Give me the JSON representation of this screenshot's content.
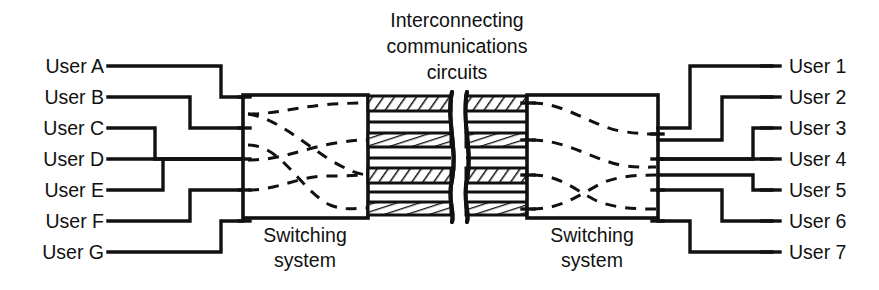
{
  "figure": {
    "title_lines": [
      "Interconnecting",
      "communications",
      "circuits"
    ],
    "title_full": "Interconnecting communications circuits",
    "background_color": "#ffffff",
    "line_color": "#111111",
    "hatch_color": "#111111"
  },
  "left_users": [
    {
      "label": "User A",
      "y": 66
    },
    {
      "label": "User B",
      "y": 97
    },
    {
      "label": "User C",
      "y": 128
    },
    {
      "label": "User D",
      "y": 159
    },
    {
      "label": "User E",
      "y": 190
    },
    {
      "label": "User F",
      "y": 221
    },
    {
      "label": "User G",
      "y": 252
    }
  ],
  "right_users": [
    {
      "label": "User 1",
      "y": 66
    },
    {
      "label": "User 2",
      "y": 97
    },
    {
      "label": "User 3",
      "y": 128
    },
    {
      "label": "User 4",
      "y": 159
    },
    {
      "label": "User 5",
      "y": 190
    },
    {
      "label": "User 6",
      "y": 221
    },
    {
      "label": "User 7",
      "y": 252
    }
  ],
  "switches": [
    {
      "id": "left-switch",
      "caption_lines": [
        "Switching",
        "system"
      ],
      "caption": "Switching system"
    },
    {
      "id": "right-switch",
      "caption_lines": [
        "Switching",
        "system"
      ],
      "caption": "Switching system"
    }
  ],
  "trunks": [
    {
      "index": 1,
      "y": 103,
      "style": "diagonal-hatch"
    },
    {
      "index": 2,
      "y": 140,
      "style": "vertical-tick-hatch"
    },
    {
      "index": 3,
      "y": 175,
      "style": "diagonal-hatch"
    },
    {
      "index": 4,
      "y": 208,
      "style": "vertical-tick-hatch"
    }
  ],
  "trunk_count": 4,
  "user_count_left": 7,
  "user_count_right": 7,
  "break_symbol": "wavy-double-line"
}
